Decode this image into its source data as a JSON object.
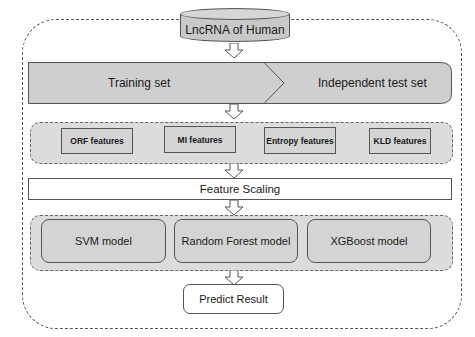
{
  "diagram": {
    "source_node": {
      "label": "LncRNA of Human",
      "shape": "cylinder"
    },
    "split": {
      "left_label": "Training set",
      "right_label": "Independent test set"
    },
    "features": {
      "items": [
        {
          "label": "ORF features"
        },
        {
          "label": "MI features"
        },
        {
          "label": "Entropy features"
        },
        {
          "label": "KLD features"
        }
      ]
    },
    "scaling": {
      "label": "Feature Scaling"
    },
    "models": {
      "items": [
        {
          "label": "SVM model"
        },
        {
          "label": "Random Forest model"
        },
        {
          "label": "XGBoost model"
        }
      ]
    },
    "output": {
      "label": "Predict Result"
    },
    "colors": {
      "fill_gray": "#d4d4d4",
      "group_gray": "#dcdcdc",
      "stroke": "#555555",
      "background": "#ffffff"
    }
  }
}
